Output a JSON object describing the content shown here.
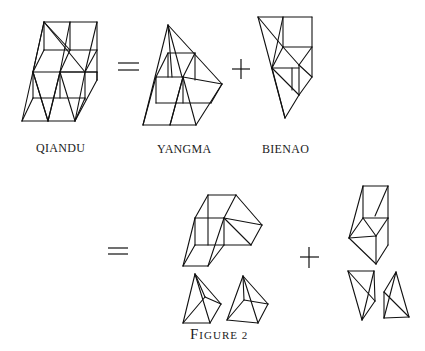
{
  "figure": {
    "caption": "Figure 2",
    "caption_first": "F",
    "caption_rest": "IGURE 2",
    "labels": {
      "qiandu": "QIANDU",
      "yangma": "YANGMA",
      "bienao": "BIENAO"
    },
    "operators": {
      "equals": "=",
      "plus": "+"
    },
    "stroke_color": "#111111",
    "background": "#ffffff",
    "solids": {
      "qiandu": [
        [
          44,
          22,
          97,
          22
        ],
        [
          70,
          22,
          70,
          50
        ],
        [
          97,
          22,
          97,
          80
        ],
        [
          44,
          22,
          70,
          50
        ],
        [
          44,
          22,
          33,
          72
        ],
        [
          44,
          22,
          22,
          121
        ],
        [
          70,
          22,
          60,
          72
        ],
        [
          97,
          22,
          85,
          72
        ],
        [
          44,
          22,
          85,
          72
        ],
        [
          44,
          50,
          97,
          50
        ],
        [
          44,
          50,
          33,
          72
        ],
        [
          70,
          50,
          60,
          72
        ],
        [
          97,
          50,
          85,
          72
        ],
        [
          33,
          72,
          97,
          72
        ],
        [
          33,
          72,
          33,
          98
        ],
        [
          97,
          72,
          97,
          80
        ],
        [
          33,
          98,
          85,
          98
        ],
        [
          85,
          72,
          85,
          100
        ],
        [
          60,
          72,
          60,
          98
        ],
        [
          22,
          121,
          75,
          121
        ],
        [
          22,
          121,
          33,
          98
        ],
        [
          48,
          121,
          60,
          72
        ],
        [
          48,
          121,
          33,
          72
        ],
        [
          75,
          121,
          85,
          98
        ],
        [
          75,
          121,
          97,
          80
        ],
        [
          60,
          72,
          75,
          121
        ],
        [
          60,
          72,
          48,
          121
        ],
        [
          33,
          72,
          48,
          121
        ],
        [
          85,
          72,
          75,
          121
        ],
        [
          44,
          22,
          44,
          50
        ],
        [
          60,
          72,
          97,
          72
        ]
      ],
      "yangma": [
        [
          168,
          25,
          143,
          125
        ],
        [
          168,
          25,
          172,
          77
        ],
        [
          168,
          25,
          182,
          77
        ],
        [
          168,
          25,
          222,
          84
        ],
        [
          168,
          53,
          195,
          53
        ],
        [
          168,
          53,
          168,
          77
        ],
        [
          195,
          53,
          195,
          80
        ],
        [
          168,
          53,
          156,
          77
        ],
        [
          195,
          53,
          183,
          77
        ],
        [
          156,
          77,
          183,
          77
        ],
        [
          156,
          77,
          156,
          103
        ],
        [
          183,
          77,
          222,
          84
        ],
        [
          183,
          77,
          196,
          125
        ],
        [
          183,
          77,
          170,
          125
        ],
        [
          183,
          77,
          183,
          103
        ],
        [
          156,
          103,
          211,
          103
        ],
        [
          143,
          125,
          156,
          77
        ],
        [
          143,
          125,
          196,
          125
        ],
        [
          196,
          125,
          222,
          84
        ],
        [
          170,
          125,
          183,
          77
        ],
        [
          211,
          103,
          222,
          84
        ]
      ],
      "bienao": [
        [
          258,
          17,
          312,
          17
        ],
        [
          258,
          17,
          285,
          118
        ],
        [
          283,
          17,
          283,
          47
        ],
        [
          312,
          17,
          312,
          77
        ],
        [
          258,
          17,
          283,
          47
        ],
        [
          283,
          17,
          272,
          68
        ],
        [
          283,
          47,
          312,
          47
        ],
        [
          283,
          47,
          272,
          68
        ],
        [
          283,
          47,
          299,
          65
        ],
        [
          312,
          47,
          299,
          65
        ],
        [
          272,
          68,
          299,
          68
        ],
        [
          299,
          65,
          312,
          77
        ],
        [
          299,
          65,
          299,
          95
        ],
        [
          272,
          68,
          299,
          95
        ],
        [
          272,
          68,
          285,
          118
        ],
        [
          299,
          95,
          285,
          118
        ],
        [
          312,
          77,
          299,
          95
        ],
        [
          292,
          68,
          292,
          90
        ]
      ],
      "qiandu_lower": [
        [
          208,
          195,
          236,
          195
        ],
        [
          208,
          195,
          195,
          218
        ],
        [
          236,
          195,
          224,
          218
        ],
        [
          236,
          195,
          262,
          225
        ],
        [
          195,
          218,
          224,
          218
        ],
        [
          195,
          218,
          195,
          245
        ],
        [
          224,
          218,
          224,
          245
        ],
        [
          224,
          218,
          251,
          245
        ],
        [
          224,
          218,
          262,
          225
        ],
        [
          195,
          245,
          251,
          245
        ],
        [
          251,
          245,
          262,
          225
        ],
        [
          208,
          195,
          208,
          245
        ],
        [
          183,
          266,
          208,
          266
        ],
        [
          183,
          266,
          195,
          218
        ],
        [
          208,
          266,
          224,
          218
        ],
        [
          183,
          266,
          195,
          245
        ],
        [
          208,
          266,
          224,
          245
        ]
      ],
      "yangma_a": [
        [
          195,
          274,
          183,
          323
        ],
        [
          195,
          274,
          205,
          297
        ],
        [
          195,
          274,
          221,
          304
        ],
        [
          195,
          274,
          210,
          323
        ],
        [
          205,
          297,
          221,
          304
        ],
        [
          183,
          323,
          210,
          323
        ],
        [
          210,
          323,
          221,
          304
        ],
        [
          183,
          323,
          205,
          297
        ]
      ],
      "yangma_b": [
        [
          243,
          276,
          227,
          320
        ],
        [
          243,
          276,
          244,
          300
        ],
        [
          243,
          276,
          268,
          304
        ],
        [
          243,
          276,
          258,
          323
        ],
        [
          244,
          300,
          268,
          304
        ],
        [
          227,
          320,
          258,
          323
        ],
        [
          258,
          323,
          268,
          304
        ],
        [
          227,
          320,
          244,
          300
        ]
      ],
      "bienao_upper": [
        [
          363,
          186,
          388,
          186
        ],
        [
          363,
          186,
          349,
          238
        ],
        [
          388,
          186,
          388,
          218
        ],
        [
          363,
          186,
          363,
          218
        ],
        [
          388,
          186,
          375,
          216
        ],
        [
          363,
          218,
          388,
          218
        ],
        [
          363,
          218,
          349,
          238
        ],
        [
          363,
          218,
          376,
          236
        ],
        [
          349,
          238,
          376,
          236
        ],
        [
          388,
          218,
          376,
          236
        ],
        [
          349,
          238,
          376,
          264
        ],
        [
          376,
          236,
          376,
          264
        ],
        [
          388,
          218,
          388,
          245
        ],
        [
          388,
          245,
          376,
          264
        ]
      ],
      "bienao_a": [
        [
          348,
          271,
          374,
          271
        ],
        [
          348,
          271,
          362,
          320
        ],
        [
          374,
          271,
          375,
          301
        ],
        [
          348,
          271,
          375,
          301
        ],
        [
          375,
          301,
          362,
          320
        ],
        [
          374,
          271,
          362,
          320
        ]
      ],
      "bienao_b": [
        [
          396,
          272,
          384,
          292
        ],
        [
          396,
          272,
          409,
          317
        ],
        [
          384,
          292,
          384,
          318
        ],
        [
          384,
          318,
          409,
          317
        ],
        [
          384,
          292,
          409,
          317
        ],
        [
          396,
          272,
          384,
          318
        ]
      ]
    },
    "text_positions": {
      "qiandu": [
        30,
        147
      ],
      "yangma": [
        159,
        148
      ],
      "bienao": [
        262,
        148
      ],
      "caption": [
        211,
        337
      ]
    }
  }
}
